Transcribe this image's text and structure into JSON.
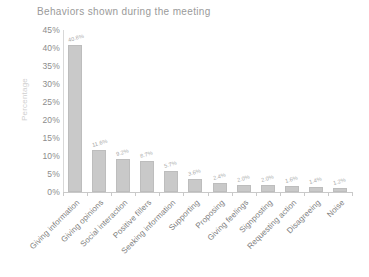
{
  "chart_data": {
    "type": "bar",
    "title": "Behaviors shown during the meeting",
    "xlabel": "",
    "ylabel": "Percentage",
    "ylim": [
      0,
      45
    ],
    "ytick_labels": [
      "45%",
      "40%",
      "35%",
      "30%",
      "25%",
      "20%",
      "15%",
      "10%",
      "5%",
      "0%"
    ],
    "ytick_values": [
      45,
      40,
      35,
      30,
      25,
      20,
      15,
      10,
      5,
      0
    ],
    "grid": false,
    "legend": "none",
    "categories": [
      "Giving information",
      "Giving opinions",
      "Social interaction",
      "Positive fillers",
      "Seeking information",
      "Supporting",
      "Proposing",
      "Giving feelings",
      "Signposting",
      "Requesting action",
      "Disagreeing",
      "Noise"
    ],
    "values": [
      40.8,
      11.6,
      9.2,
      8.7,
      5.7,
      3.6,
      2.4,
      2.0,
      2.0,
      1.6,
      1.4,
      1.2
    ],
    "data_labels": [
      "40.8%",
      "11.6%",
      "9.2%",
      "8.7%",
      "5.7%",
      "3.6%",
      "2.4%",
      "2.0%",
      "2.0%",
      "1.6%",
      "1.4%",
      "1.2%"
    ],
    "bar_color": "#c9c9c9",
    "title_color": "#9a9a9a",
    "axis_color": "#8c8c8c"
  }
}
